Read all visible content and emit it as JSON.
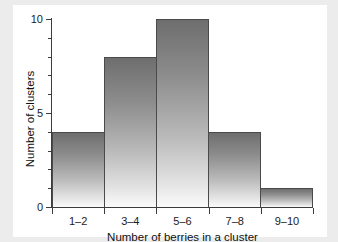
{
  "chart_data": {
    "type": "bar",
    "title": "",
    "xlabel": "Number of berries in a cluster",
    "ylabel": "Number of clusters",
    "categories": [
      "1–2",
      "3–4",
      "5–6",
      "7–8",
      "9–10"
    ],
    "values": [
      4,
      8,
      10,
      4,
      1
    ],
    "ylim": [
      0,
      10
    ],
    "ytick_labels": [
      "0",
      "5",
      "10"
    ],
    "ytick_values": [
      0,
      5,
      10
    ],
    "yminor_values": [
      1,
      2,
      3,
      4,
      6,
      7,
      8,
      9
    ],
    "grid": false,
    "legend": null,
    "colors": {
      "bar_top": "#6e6e6e",
      "bar_bottom": "#fbfbfb",
      "bar_edge": "#4a4a4a",
      "axis": "#3c3c3c",
      "text": "#101010",
      "plot_background": "#ffffff",
      "page_background": "#ececed"
    }
  }
}
